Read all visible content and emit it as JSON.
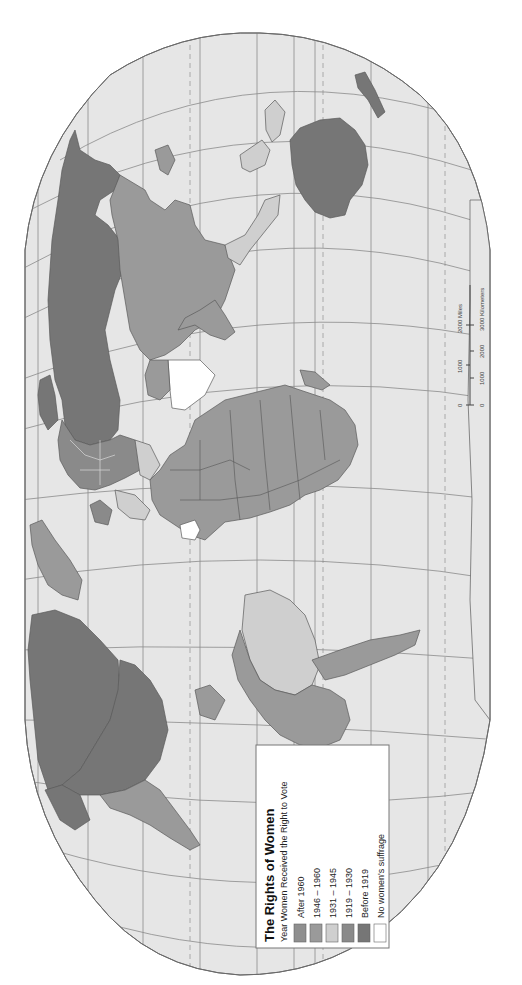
{
  "map": {
    "orientation": "rotated 90deg counter-clockwise (north at left)",
    "ocean_color": "#e6e6e6",
    "outline_color": "#6a6a6a"
  },
  "legend": {
    "title": "The Rights of Women",
    "subtitle": "Year Women Received the Right to Vote",
    "items": [
      {
        "label": "After 1960",
        "color": "#8f8f8f"
      },
      {
        "label": "1946 – 1960",
        "color": "#9a9a9a"
      },
      {
        "label": "1931 – 1945",
        "color": "#cfcfcf"
      },
      {
        "label": "1919 – 1930",
        "color": "#8a8a8a"
      },
      {
        "label": "Before 1919",
        "color": "#767676"
      },
      {
        "label": "No women's suffrage",
        "color": "#ffffff"
      }
    ]
  },
  "scale_bar": {
    "miles_labels": [
      "0",
      "1000",
      "2000 Miles"
    ],
    "km_labels": [
      "0",
      "1000",
      "2000",
      "3000 Kilometers"
    ]
  },
  "regions": {
    "north_america_usa": {
      "category": "Before 1919",
      "color": "#767676"
    },
    "canada": {
      "category": "Before 1919",
      "color": "#767676"
    },
    "mexico_central_america": {
      "category": "1946 – 1960",
      "color": "#9a9a9a"
    },
    "south_america_east": {
      "category": "1931 – 1945",
      "color": "#cfcfcf"
    },
    "south_america_west": {
      "category": "1946 – 1960",
      "color": "#9a9a9a"
    },
    "greenland": {
      "category": "1946 – 1960",
      "color": "#9a9a9a"
    },
    "russia": {
      "category": "Before 1919",
      "color": "#767676"
    },
    "europe": {
      "category": "1919 – 1930",
      "color": "#8a8a8a"
    },
    "africa": {
      "category": "1946 – 1960",
      "color": "#9a9a9a"
    },
    "saudi_arabia": {
      "category": "No women's suffrage",
      "color": "#ffffff"
    },
    "china_asia": {
      "category": "1946 – 1960",
      "color": "#9a9a9a"
    },
    "india_south_asia": {
      "category": "1946 – 1960",
      "color": "#9a9a9a"
    },
    "australia": {
      "category": "Before 1919",
      "color": "#767676"
    },
    "southeast_asia": {
      "category": "1931 – 1945",
      "color": "#cfcfcf"
    }
  }
}
